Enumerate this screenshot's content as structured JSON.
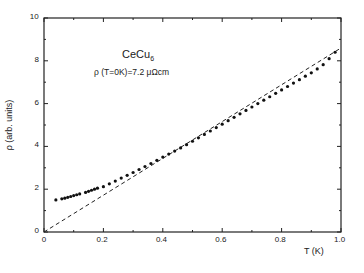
{
  "chart_data": {
    "type": "scatter",
    "title": "",
    "annotation": {
      "compound": "CeCu",
      "compound_subscript": "6",
      "residual": "ρ (T=0K)=7.2 μΩcm"
    },
    "xlabel": "T (K)",
    "ylabel": "ρ (arb. units)",
    "xlim": [
      0,
      1.0
    ],
    "ylim": [
      0,
      10
    ],
    "xticks": [
      "0",
      "0.2",
      "0.4",
      "0.6",
      "0.8",
      "1.0"
    ],
    "yticks": [
      "0",
      "2",
      "4",
      "6",
      "8",
      "10"
    ],
    "grid": false,
    "legend": null,
    "series": [
      {
        "name": "measured resistivity",
        "style": "points",
        "x": [
          0.04,
          0.06,
          0.07,
          0.08,
          0.09,
          0.1,
          0.11,
          0.12,
          0.14,
          0.15,
          0.16,
          0.17,
          0.18,
          0.2,
          0.22,
          0.24,
          0.26,
          0.28,
          0.3,
          0.32,
          0.34,
          0.36,
          0.38,
          0.4,
          0.42,
          0.44,
          0.46,
          0.48,
          0.5,
          0.52,
          0.54,
          0.56,
          0.58,
          0.6,
          0.62,
          0.64,
          0.66,
          0.68,
          0.7,
          0.72,
          0.74,
          0.76,
          0.78,
          0.8,
          0.82,
          0.84,
          0.86,
          0.88,
          0.9,
          0.92,
          0.94,
          0.96,
          0.98
        ],
        "y": [
          1.5,
          1.55,
          1.58,
          1.62,
          1.66,
          1.7,
          1.74,
          1.78,
          1.85,
          1.9,
          1.95,
          2.0,
          2.05,
          2.12,
          2.25,
          2.38,
          2.52,
          2.65,
          2.78,
          2.92,
          3.06,
          3.2,
          3.35,
          3.5,
          3.64,
          3.78,
          3.93,
          4.08,
          4.24,
          4.4,
          4.56,
          4.72,
          4.88,
          5.04,
          5.2,
          5.36,
          5.52,
          5.68,
          5.84,
          6.0,
          6.16,
          6.32,
          6.48,
          6.64,
          6.8,
          6.96,
          7.12,
          7.28,
          7.44,
          7.62,
          7.82,
          8.1,
          8.4
        ]
      },
      {
        "name": "linear extrapolation",
        "style": "dashed-line",
        "x": [
          0,
          1.0
        ],
        "y": [
          0,
          8.6
        ]
      }
    ]
  }
}
